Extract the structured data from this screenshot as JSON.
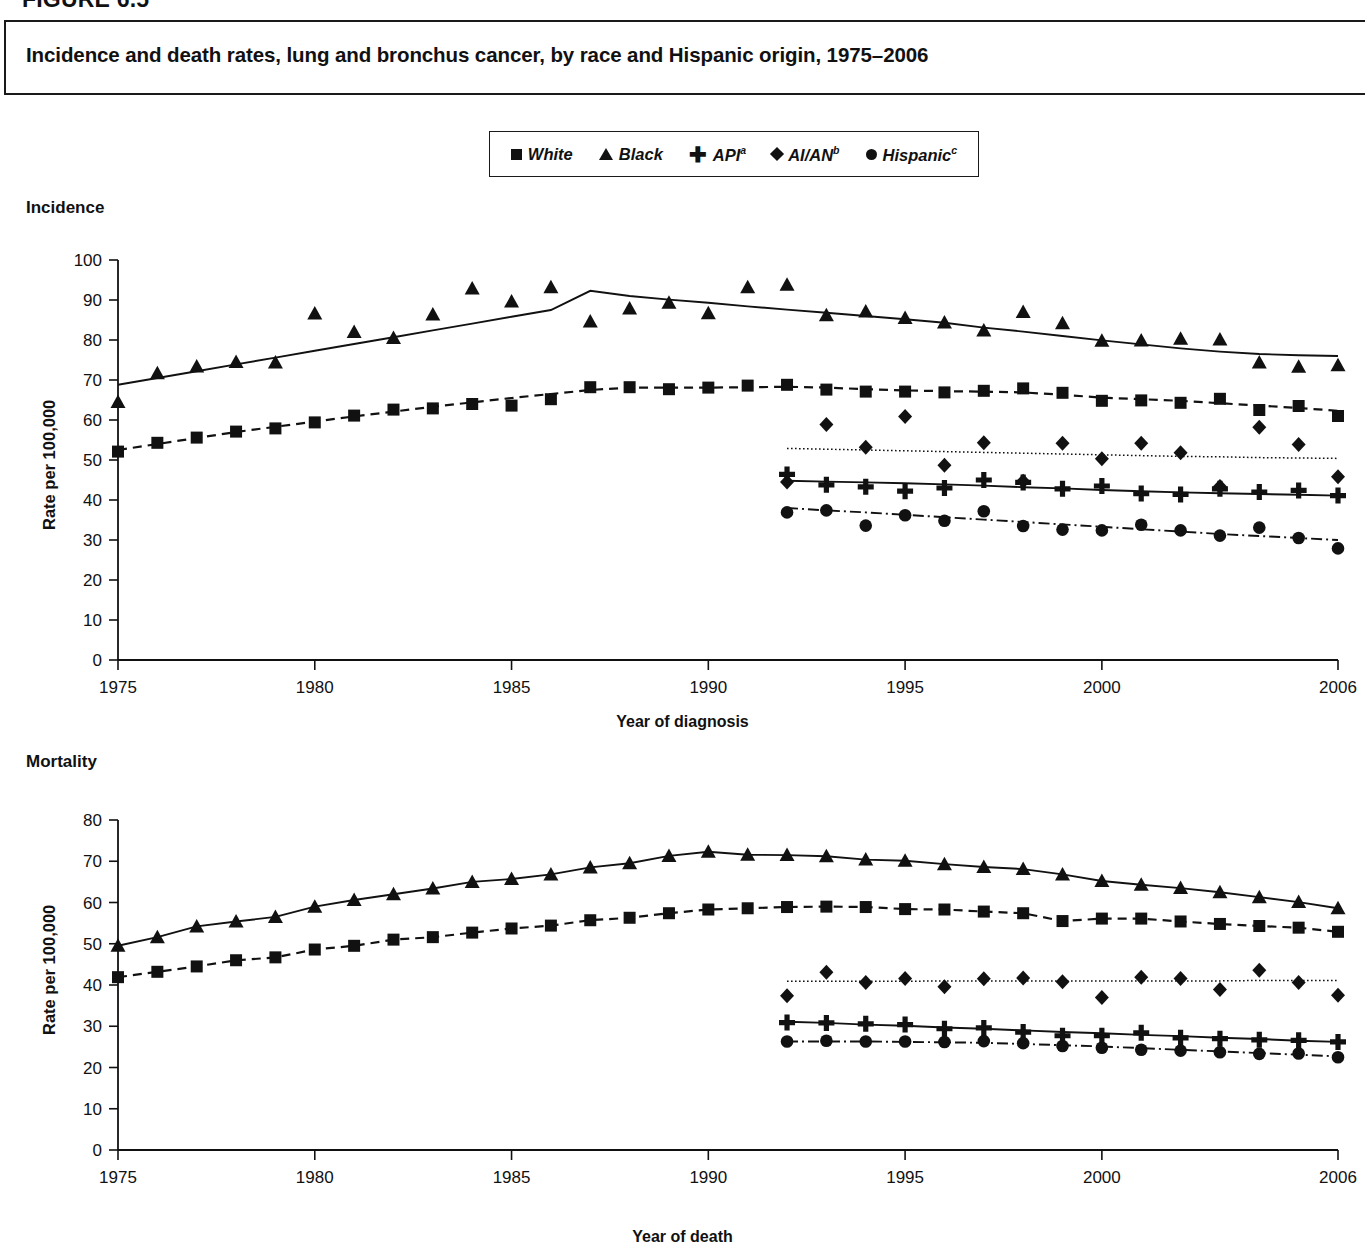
{
  "figure": {
    "number": "FIGURE 6.5",
    "title": "Incidence and death rates, lung and bronchus cancer, by race and Hispanic origin, 1975–2006"
  },
  "legend": {
    "position": "top-center",
    "entries": [
      {
        "marker": "square-marker",
        "label": "White",
        "sup": ""
      },
      {
        "marker": "triangle-marker",
        "label": "Black",
        "sup": ""
      },
      {
        "marker": "plus-marker",
        "label": "API",
        "sup": "a"
      },
      {
        "marker": "diamond-marker",
        "label": "AI/AN",
        "sup": "b"
      },
      {
        "marker": "circle-marker",
        "label": "Hispanic",
        "sup": "c"
      }
    ]
  },
  "panels": {
    "incidence": {
      "caption": "Incidence",
      "xlabel": "Year of diagnosis",
      "ylabel": "Rate per 100,000",
      "yticks": [
        "100",
        "90",
        "80",
        "70",
        "60",
        "50",
        "40",
        "30",
        "20",
        "10",
        "0"
      ],
      "xticks": [
        "1975",
        "1980",
        "1985",
        "1990",
        "1995",
        "2000",
        "2006"
      ]
    },
    "mortality": {
      "caption": "Mortality",
      "xlabel": "Year of death",
      "ylabel": "Rate per 100,000",
      "yticks": [
        "80",
        "70",
        "60",
        "50",
        "40",
        "30",
        "20",
        "10",
        "0"
      ],
      "xticks": [
        "1975",
        "1980",
        "1985",
        "1990",
        "1995",
        "2000",
        "2006"
      ]
    }
  },
  "chart_data": [
    {
      "type": "scatter",
      "id": "incidence",
      "title": "Incidence",
      "xlabel": "Year of diagnosis",
      "ylabel": "Rate per 100,000",
      "xlim": [
        1975,
        2006
      ],
      "ylim": [
        0,
        100
      ],
      "ytick_step": 10,
      "xticks": [
        1975,
        1980,
        1985,
        1990,
        1995,
        2000,
        2006
      ],
      "grid": false,
      "legend": "top-center",
      "series": [
        {
          "name": "White",
          "marker": "square",
          "linestyle": "dashed",
          "x": [
            1975,
            1976,
            1977,
            1978,
            1979,
            1980,
            1981,
            1982,
            1983,
            1984,
            1985,
            1986,
            1987,
            1988,
            1989,
            1990,
            1991,
            1992,
            1993,
            1994,
            1995,
            1996,
            1997,
            1998,
            1999,
            2000,
            2001,
            2002,
            2003,
            2004,
            2005,
            2006
          ],
          "y": [
            52.1,
            54.3,
            55.6,
            57.1,
            57.9,
            59.4,
            61.1,
            62.6,
            62.9,
            64.0,
            63.6,
            65.2,
            68.2,
            68.2,
            67.7,
            68.1,
            68.6,
            68.8,
            67.6,
            67.1,
            67.1,
            66.9,
            67.3,
            67.9,
            66.8,
            64.8,
            64.9,
            64.3,
            65.3,
            62.5,
            63.5,
            61.0
          ],
          "trend_y": [
            52.5,
            54.0,
            55.5,
            57.0,
            58.3,
            59.6,
            60.9,
            62.1,
            63.3,
            64.4,
            65.5,
            66.5,
            67.5,
            68.1,
            68.1,
            68.1,
            68.2,
            68.3,
            68.1,
            67.7,
            67.4,
            67.2,
            67.1,
            66.9,
            66.3,
            65.6,
            65.2,
            64.8,
            64.2,
            63.6,
            63.0,
            62.3
          ]
        },
        {
          "name": "Black",
          "marker": "triangle",
          "linestyle": "solid",
          "x": [
            1975,
            1976,
            1977,
            1978,
            1979,
            1980,
            1981,
            1982,
            1983,
            1984,
            1985,
            1986,
            1987,
            1988,
            1989,
            1990,
            1991,
            1992,
            1993,
            1994,
            1995,
            1996,
            1997,
            1998,
            1999,
            2000,
            2001,
            2002,
            2003,
            2004,
            2005,
            2006
          ],
          "y": [
            64.5,
            71.7,
            73.4,
            74.5,
            74.4,
            86.6,
            82.0,
            80.5,
            86.4,
            92.9,
            89.6,
            93.2,
            84.6,
            87.9,
            89.3,
            86.7,
            93.2,
            93.8,
            86.2,
            87.1,
            85.5,
            84.4,
            82.4,
            87.0,
            84.2,
            79.8,
            79.9,
            80.3,
            80.1,
            74.4,
            73.3,
            73.7
          ],
          "trend_y": [
            68.8,
            70.5,
            72.2,
            73.9,
            75.6,
            77.3,
            79.0,
            80.7,
            82.4,
            84.1,
            85.8,
            87.5,
            92.3,
            91.0,
            90.1,
            89.3,
            88.4,
            87.6,
            86.8,
            86.0,
            85.2,
            84.3,
            83.1,
            82.1,
            81.0,
            79.9,
            78.9,
            77.9,
            77.1,
            76.5,
            76.2,
            76.0
          ]
        },
        {
          "name": "API",
          "marker": "plus",
          "linestyle": "solid",
          "x": [
            1992,
            1993,
            1994,
            1995,
            1996,
            1997,
            1998,
            1999,
            2000,
            2001,
            2002,
            2003,
            2004,
            2005,
            2006
          ],
          "y": [
            46.4,
            43.8,
            43.3,
            42.2,
            43.0,
            45.0,
            44.4,
            42.8,
            43.5,
            41.6,
            41.4,
            42.8,
            42.0,
            42.4,
            41.1
          ],
          "trend_y": [
            44.8,
            44.6,
            44.4,
            44.2,
            43.9,
            43.6,
            43.2,
            42.9,
            42.5,
            42.2,
            41.9,
            41.7,
            41.5,
            41.3,
            41.1
          ]
        },
        {
          "name": "AI/AN",
          "marker": "diamond",
          "linestyle": "dotted",
          "x": [
            1992,
            1993,
            1994,
            1995,
            1996,
            1997,
            1998,
            1999,
            2000,
            2001,
            2002,
            2003,
            2004,
            2005,
            2006
          ],
          "y": [
            44.5,
            58.9,
            53.2,
            60.9,
            48.7,
            54.3,
            44.7,
            54.2,
            50.3,
            54.2,
            51.8,
            43.4,
            58.2,
            53.9,
            45.8
          ],
          "trend_y": [
            52.9,
            52.7,
            52.5,
            52.3,
            52.1,
            51.9,
            51.7,
            51.5,
            51.3,
            51.1,
            50.9,
            50.8,
            50.6,
            50.5,
            50.4
          ]
        },
        {
          "name": "Hispanic",
          "marker": "circle",
          "linestyle": "dashdot",
          "x": [
            1992,
            1993,
            1994,
            1995,
            1996,
            1997,
            1998,
            1999,
            2000,
            2001,
            2002,
            2003,
            2004,
            2005,
            2006
          ],
          "y": [
            36.9,
            37.4,
            33.6,
            36.2,
            34.8,
            37.2,
            33.5,
            32.6,
            32.4,
            33.8,
            32.4,
            31.1,
            33.1,
            30.5,
            27.9
          ],
          "trend_y": [
            38.0,
            37.4,
            36.9,
            36.3,
            35.7,
            35.1,
            34.5,
            33.9,
            33.3,
            32.7,
            32.1,
            31.5,
            31.0,
            30.5,
            30.0
          ]
        }
      ]
    },
    {
      "type": "scatter",
      "id": "mortality",
      "title": "Mortality",
      "xlabel": "Year of death",
      "ylabel": "Rate per 100,000",
      "xlim": [
        1975,
        2006
      ],
      "ylim": [
        0,
        80
      ],
      "ytick_step": 10,
      "xticks": [
        1975,
        1980,
        1985,
        1990,
        1995,
        2000,
        2006
      ],
      "grid": false,
      "legend": "top-center",
      "series": [
        {
          "name": "White",
          "marker": "square",
          "linestyle": "dashed",
          "x": [
            1975,
            1976,
            1977,
            1978,
            1979,
            1980,
            1981,
            1982,
            1983,
            1984,
            1985,
            1986,
            1987,
            1988,
            1989,
            1990,
            1991,
            1992,
            1993,
            1994,
            1995,
            1996,
            1997,
            1998,
            1999,
            2000,
            2001,
            2002,
            2003,
            2004,
            2005,
            2006
          ],
          "y": [
            41.9,
            43.2,
            44.5,
            46.0,
            46.7,
            48.6,
            49.5,
            51.0,
            51.6,
            52.7,
            53.7,
            54.4,
            55.7,
            56.3,
            57.4,
            58.3,
            58.6,
            58.9,
            59.0,
            58.9,
            58.4,
            58.3,
            57.8,
            57.4,
            55.5,
            56.1,
            56.1,
            55.4,
            54.8,
            54.3,
            53.9,
            52.9
          ]
        },
        {
          "name": "Black",
          "marker": "triangle",
          "linestyle": "solid",
          "x": [
            1975,
            1976,
            1977,
            1978,
            1979,
            1980,
            1981,
            1982,
            1983,
            1984,
            1985,
            1986,
            1987,
            1988,
            1989,
            1990,
            1991,
            1992,
            1993,
            1994,
            1995,
            1996,
            1997,
            1998,
            1999,
            2000,
            2001,
            2002,
            2003,
            2004,
            2005,
            2006
          ],
          "y": [
            49.5,
            51.6,
            54.2,
            55.4,
            56.5,
            59.0,
            60.6,
            62.0,
            63.4,
            65.0,
            65.7,
            66.8,
            68.5,
            69.5,
            71.3,
            72.3,
            71.6,
            71.5,
            71.2,
            70.4,
            70.1,
            69.3,
            68.6,
            68.1,
            66.8,
            65.2,
            64.3,
            63.5,
            62.5,
            61.3,
            60.1,
            58.6
          ]
        },
        {
          "name": "API",
          "marker": "plus",
          "linestyle": "solid",
          "x": [
            1992,
            1993,
            1994,
            1995,
            1996,
            1997,
            1998,
            1999,
            2000,
            2001,
            2002,
            2003,
            2004,
            2005,
            2006
          ],
          "y": [
            30.9,
            30.8,
            30.6,
            30.4,
            29.4,
            29.6,
            28.6,
            27.7,
            27.7,
            28.4,
            27.2,
            27.0,
            26.7,
            26.6,
            26.2
          ],
          "trend_y": [
            31.1,
            30.8,
            30.4,
            30.1,
            29.7,
            29.4,
            29.0,
            28.6,
            28.3,
            27.9,
            27.6,
            27.2,
            26.9,
            26.5,
            26.2
          ]
        },
        {
          "name": "AI/AN",
          "marker": "diamond",
          "linestyle": "dotted",
          "x": [
            1992,
            1993,
            1994,
            1995,
            1996,
            1997,
            1998,
            1999,
            2000,
            2001,
            2002,
            2003,
            2004,
            2005,
            2006
          ],
          "y": [
            37.4,
            43.1,
            40.6,
            41.6,
            39.6,
            41.5,
            41.7,
            40.8,
            37.0,
            41.9,
            41.6,
            38.9,
            43.6,
            40.6,
            37.5
          ],
          "trend_y": [
            40.9,
            40.9,
            40.9,
            40.9,
            41.0,
            41.0,
            41.0,
            41.0,
            41.0,
            41.0,
            41.0,
            41.0,
            41.1,
            41.1,
            41.1
          ]
        },
        {
          "name": "Hispanic",
          "marker": "circle",
          "linestyle": "dashdot",
          "x": [
            1992,
            1993,
            1994,
            1995,
            1996,
            1997,
            1998,
            1999,
            2000,
            2001,
            2002,
            2003,
            2004,
            2005,
            2006
          ],
          "y": [
            26.3,
            26.5,
            26.3,
            26.3,
            26.2,
            26.4,
            25.9,
            25.2,
            24.8,
            24.3,
            24.1,
            23.7,
            23.3,
            23.4,
            22.5
          ],
          "trend_y": [
            26.3,
            26.3,
            26.3,
            26.2,
            26.1,
            26.0,
            25.7,
            25.4,
            25.1,
            24.7,
            24.3,
            23.9,
            23.5,
            23.1,
            22.7
          ]
        }
      ]
    }
  ]
}
